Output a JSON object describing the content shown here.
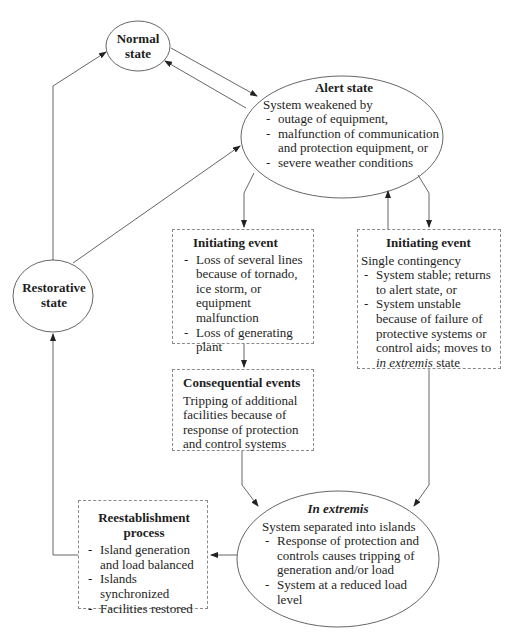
{
  "diagram": {
    "colors": {
      "line": "#555555",
      "dashed_border": "#8a8a8a",
      "text": "#1e1e1e",
      "background": "#ffffff"
    },
    "normal_state": {
      "title_line1": "Normal",
      "title_line2": "state"
    },
    "restorative_state": {
      "title_line1": "Restorative",
      "title_line2": "state"
    },
    "alert_state": {
      "title": "Alert state",
      "lead": "System weakened by",
      "items": [
        "outage of equipment,",
        "malfunction of communication and protection equipment, or",
        "severe weather conditions"
      ]
    },
    "initiating_event_left": {
      "title": "Initiating event",
      "items": [
        "Loss of several lines because of tornado, ice storm, or equipment malfunction",
        "Loss of generating plant"
      ]
    },
    "initiating_event_right": {
      "title": "Initiating event",
      "lead": "Single contingency",
      "items": [
        "System stable; returns to alert state, or",
        "System unstable because of failure of protective systems or control aids; moves to"
      ],
      "item2_italic": "in extremis",
      "item2_tail": "state"
    },
    "consequential_events": {
      "title": "Consequential events",
      "text": "Tripping of additional facilities because of response of protection and control systems"
    },
    "in_extremis": {
      "title": "In extremis",
      "lead": "System separated into islands",
      "items": [
        "Response of protection and controls causes tripping of generation and/or load",
        "System at a reduced load level"
      ]
    },
    "reestablishment": {
      "title_line1": "Reestablishment",
      "title_line2": "process",
      "items": [
        "Island generation and load balanced",
        "Islands synchronized",
        "Facilities restored"
      ]
    },
    "edges": [
      {
        "from": "normal_state",
        "to": "alert_state"
      },
      {
        "from": "alert_state",
        "to": "normal_state"
      },
      {
        "from": "alert_state",
        "to": "initiating_event_left"
      },
      {
        "from": "alert_state",
        "to": "initiating_event_right"
      },
      {
        "from": "initiating_event_right",
        "to": "alert_state"
      },
      {
        "from": "initiating_event_left",
        "to": "consequential_events"
      },
      {
        "from": "consequential_events",
        "to": "in_extremis"
      },
      {
        "from": "initiating_event_right",
        "to": "in_extremis"
      },
      {
        "from": "in_extremis",
        "to": "reestablishment"
      },
      {
        "from": "reestablishment",
        "to": "restorative_state"
      },
      {
        "from": "restorative_state",
        "to": "normal_state"
      },
      {
        "from": "restorative_state",
        "to": "alert_state"
      }
    ]
  }
}
